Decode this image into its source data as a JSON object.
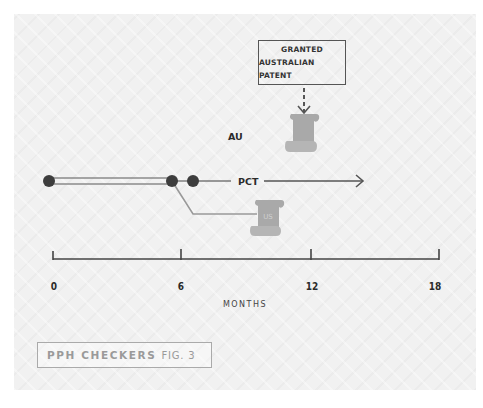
{
  "figure": {
    "granted_box": {
      "line1": "GRANTED",
      "line2": "AUSTRALIAN PATENT"
    },
    "labels": {
      "au": "AU",
      "pct": "PCT",
      "us_scroll": "US"
    },
    "axis": {
      "ticks": [
        "0",
        "6",
        "12",
        "18"
      ],
      "title": "MONTHS"
    },
    "caption": {
      "brand": "PPH CHECKERS",
      "fig": "FIG. 3"
    },
    "colors": {
      "line_dark": "#555555",
      "line_light": "#9a9a9a",
      "dot": "#3d3d3d",
      "scroll": "#a9a9a9",
      "panel_bg": "#f1f1f1"
    }
  }
}
